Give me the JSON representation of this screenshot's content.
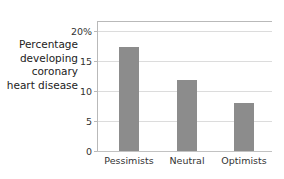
{
  "chart_data": {
    "type": "bar",
    "title": "",
    "xlabel": "",
    "ylabel": "Percentage developing coronary heart disease",
    "categories": [
      "Pessimists",
      "Neutral",
      "Optimists"
    ],
    "values": [
      17.3,
      11.9,
      8.0
    ],
    "ylim": [
      0,
      20
    ],
    "yticks": [
      0,
      5,
      10,
      15,
      20
    ],
    "ytick_labels": [
      "0",
      "5",
      "10",
      "15",
      "20%"
    ],
    "grid": "horizontal",
    "legend": "none",
    "series": [
      {
        "name": "Percentage developing coronary heart disease",
        "values": [
          17.3,
          11.9,
          8.0
        ]
      }
    ]
  },
  "axis": {
    "y_caption": "Percentage\ndeveloping\ncoronary\nheart disease",
    "ticks": [
      {
        "label": "20%",
        "value": 20
      },
      {
        "label": "15",
        "value": 15
      },
      {
        "label": "10",
        "value": 10
      },
      {
        "label": "5",
        "value": 5
      },
      {
        "label": "0",
        "value": 0
      }
    ]
  },
  "bars": [
    {
      "category": "Pessimists",
      "value": 17.3
    },
    {
      "category": "Neutral",
      "value": 11.9
    },
    {
      "category": "Optimists",
      "value": 8.0
    }
  ],
  "colors": {
    "bar_fill": "#8c8c8c",
    "gridline": "#dcdcdc",
    "axis_line": "#b9b9b9",
    "background": "#ffffff",
    "text": "#333333"
  }
}
